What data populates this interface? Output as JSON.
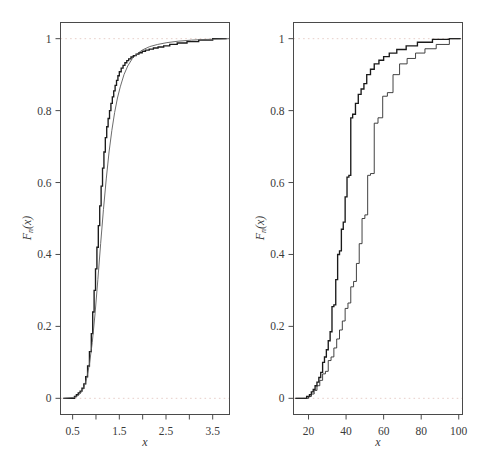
{
  "figure": {
    "background": "#ffffff",
    "panel_count": 2
  },
  "chart_data": [
    {
      "id": "left",
      "type": "line",
      "title": "",
      "subtitle": "",
      "xlabel": "x",
      "ylabel": "F_n(x)",
      "ylabel_base": "F",
      "ylabel_sub": "n",
      "ylabel_arg": "(x)",
      "xlim": [
        0.24,
        3.86
      ],
      "ylim": [
        -0.045,
        1.045
      ],
      "xticks": [
        0.5,
        1.0,
        1.5,
        2.0,
        2.5,
        3.0,
        3.5
      ],
      "xticklabels": [
        "0.5",
        "",
        "1.5",
        "",
        "2.5",
        "",
        "3.5"
      ],
      "yticks": [
        0,
        0.2,
        0.4,
        0.6,
        0.8,
        1
      ],
      "yticklabels": [
        "0",
        "0.2",
        "0.4",
        "0.6",
        "0.8",
        "1"
      ],
      "grid": false,
      "reference_lines": [
        {
          "y": 0,
          "style": "dotted",
          "color": "#e7cfc9"
        },
        {
          "y": 1,
          "style": "dotted",
          "color": "#e7cfc9"
        }
      ],
      "legend": null,
      "series": [
        {
          "name": "empirical CDF (step)",
          "style": "step",
          "stroke": "#1a1a1a",
          "x": [
            0.3,
            0.54,
            0.58,
            0.62,
            0.66,
            0.7,
            0.74,
            0.78,
            0.82,
            0.86,
            0.9,
            0.93,
            0.96,
            0.99,
            1.02,
            1.05,
            1.08,
            1.11,
            1.14,
            1.17,
            1.2,
            1.23,
            1.26,
            1.29,
            1.32,
            1.35,
            1.38,
            1.41,
            1.44,
            1.47,
            1.5,
            1.54,
            1.58,
            1.62,
            1.66,
            1.7,
            1.75,
            1.8,
            1.86,
            1.92,
            1.99,
            2.06,
            2.14,
            2.23,
            2.33,
            2.45,
            2.58,
            2.74,
            2.95,
            3.2,
            3.5,
            3.8
          ],
          "y": [
            0.0,
            0.005,
            0.01,
            0.015,
            0.02,
            0.028,
            0.04,
            0.06,
            0.09,
            0.13,
            0.18,
            0.24,
            0.3,
            0.36,
            0.42,
            0.48,
            0.535,
            0.59,
            0.64,
            0.685,
            0.725,
            0.755,
            0.778,
            0.8,
            0.82,
            0.838,
            0.855,
            0.87,
            0.884,
            0.897,
            0.908,
            0.918,
            0.926,
            0.933,
            0.939,
            0.944,
            0.949,
            0.953,
            0.957,
            0.961,
            0.965,
            0.968,
            0.971,
            0.974,
            0.977,
            0.98,
            0.984,
            0.988,
            0.992,
            0.996,
            1.0,
            1.0
          ]
        },
        {
          "name": "fitted CDF (smooth)",
          "style": "smooth",
          "stroke": "#5b5b5b",
          "x": [
            0.3,
            0.55,
            0.62,
            0.68,
            0.74,
            0.8,
            0.86,
            0.92,
            0.98,
            1.04,
            1.1,
            1.16,
            1.22,
            1.28,
            1.34,
            1.4,
            1.46,
            1.52,
            1.6,
            1.68,
            1.78,
            1.88,
            2.0,
            2.15,
            2.32,
            2.52,
            2.76,
            3.05,
            3.38,
            3.7,
            3.84
          ],
          "y": [
            0.0,
            0.003,
            0.008,
            0.016,
            0.03,
            0.055,
            0.095,
            0.155,
            0.235,
            0.33,
            0.43,
            0.525,
            0.61,
            0.685,
            0.745,
            0.795,
            0.835,
            0.866,
            0.9,
            0.924,
            0.945,
            0.958,
            0.969,
            0.978,
            0.984,
            0.989,
            0.993,
            0.996,
            0.998,
            0.999,
            1.0
          ]
        }
      ]
    },
    {
      "id": "right",
      "type": "line",
      "title": "",
      "subtitle": "",
      "xlabel": "x",
      "ylabel": "F_n(x)",
      "ylabel_base": "F",
      "ylabel_sub": "n",
      "ylabel_arg": "(x)",
      "xlim": [
        12,
        102
      ],
      "ylim": [
        -0.045,
        1.045
      ],
      "xticks": [
        20,
        40,
        60,
        80,
        100
      ],
      "xticklabels": [
        "20",
        "40",
        "60",
        "80",
        "100"
      ],
      "yticks": [
        0,
        0.2,
        0.4,
        0.6,
        0.8,
        1
      ],
      "yticklabels": [
        "0",
        "0.2",
        "0.4",
        "0.6",
        "0.8",
        "1"
      ],
      "grid": false,
      "reference_lines": [
        {
          "y": 0,
          "style": "dotted",
          "color": "#e7cfc9"
        },
        {
          "y": 1,
          "style": "dotted",
          "color": "#e7cfc9"
        }
      ],
      "legend": null,
      "series": [
        {
          "name": "sample 1 empirical CDF (left step)",
          "style": "step",
          "stroke": "#1a1a1a",
          "x": [
            13.0,
            17.5,
            19.0,
            20.5,
            21.5,
            22.5,
            23.5,
            24.5,
            25.5,
            26.5,
            27.5,
            28.5,
            29.5,
            30.5,
            31.5,
            32.5,
            33.5,
            34.5,
            35.5,
            36.5,
            37.5,
            38.5,
            39.5,
            40.5,
            41.5,
            42.5,
            43.5,
            45.0,
            46.5,
            48.0,
            49.5,
            51.0,
            53.0,
            55.0,
            57.5,
            60.0,
            63.0,
            67.0,
            72.0,
            78.0,
            86.0,
            95.0,
            101.0
          ],
          "y": [
            0.0,
            0.0,
            0.005,
            0.01,
            0.018,
            0.025,
            0.035,
            0.045,
            0.058,
            0.072,
            0.1,
            0.115,
            0.135,
            0.16,
            0.185,
            0.255,
            0.26,
            0.33,
            0.4,
            0.41,
            0.47,
            0.49,
            0.56,
            0.615,
            0.62,
            0.78,
            0.79,
            0.82,
            0.845,
            0.86,
            0.875,
            0.9,
            0.915,
            0.93,
            0.94,
            0.95,
            0.96,
            0.97,
            0.98,
            0.99,
            0.998,
            1.0,
            1.0
          ]
        },
        {
          "name": "sample 2 empirical CDF (right step)",
          "style": "step-thin",
          "stroke": "#2e2e2e",
          "x": [
            13.0,
            18.0,
            20.0,
            21.5,
            23.0,
            24.5,
            26.0,
            27.5,
            29.0,
            30.5,
            32.0,
            33.5,
            35.0,
            36.5,
            38.0,
            39.5,
            41.0,
            42.5,
            44.0,
            45.5,
            47.0,
            48.5,
            50.0,
            51.5,
            53.0,
            55.0,
            57.0,
            59.5,
            62.0,
            65.0,
            68.5,
            72.5,
            77.0,
            82.0,
            88.0,
            95.0,
            101.0
          ],
          "y": [
            0.0,
            0.0,
            0.005,
            0.012,
            0.022,
            0.035,
            0.05,
            0.068,
            0.075,
            0.105,
            0.115,
            0.14,
            0.165,
            0.19,
            0.215,
            0.25,
            0.265,
            0.31,
            0.325,
            0.375,
            0.43,
            0.5,
            0.51,
            0.62,
            0.625,
            0.765,
            0.78,
            0.84,
            0.85,
            0.9,
            0.93,
            0.945,
            0.96,
            0.972,
            0.984,
            1.0,
            1.0
          ]
        }
      ]
    }
  ]
}
